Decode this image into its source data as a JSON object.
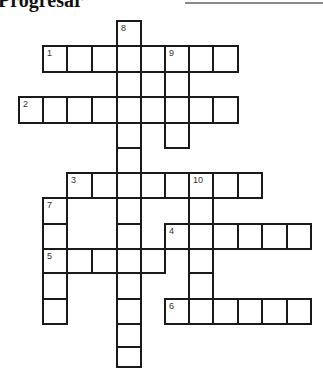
{
  "header": {
    "title": "Progresar",
    "has_name_line": true
  },
  "grid": {
    "col_x": [
      18,
      42,
      66,
      91,
      116,
      140,
      164,
      188,
      212,
      237,
      261,
      286,
      310
    ],
    "row_y": [
      20,
      45,
      71,
      96,
      122,
      147,
      172,
      197,
      223,
      248,
      272,
      298,
      323,
      346,
      366
    ],
    "cells": [
      {
        "r": 0,
        "c": 4,
        "num": "8"
      },
      {
        "r": 1,
        "c": 1,
        "num": "1"
      },
      {
        "r": 1,
        "c": 2
      },
      {
        "r": 1,
        "c": 3
      },
      {
        "r": 1,
        "c": 4
      },
      {
        "r": 1,
        "c": 5
      },
      {
        "r": 1,
        "c": 6,
        "num": "9"
      },
      {
        "r": 1,
        "c": 7
      },
      {
        "r": 1,
        "c": 8
      },
      {
        "r": 2,
        "c": 4
      },
      {
        "r": 2,
        "c": 6
      },
      {
        "r": 3,
        "c": 0,
        "num": "2"
      },
      {
        "r": 3,
        "c": 1
      },
      {
        "r": 3,
        "c": 2
      },
      {
        "r": 3,
        "c": 3
      },
      {
        "r": 3,
        "c": 4
      },
      {
        "r": 3,
        "c": 5
      },
      {
        "r": 3,
        "c": 6
      },
      {
        "r": 3,
        "c": 7
      },
      {
        "r": 3,
        "c": 8
      },
      {
        "r": 4,
        "c": 4
      },
      {
        "r": 4,
        "c": 6
      },
      {
        "r": 5,
        "c": 4
      },
      {
        "r": 6,
        "c": 2,
        "num": "3"
      },
      {
        "r": 6,
        "c": 3
      },
      {
        "r": 6,
        "c": 4
      },
      {
        "r": 6,
        "c": 5
      },
      {
        "r": 6,
        "c": 6
      },
      {
        "r": 6,
        "c": 7,
        "num": "10"
      },
      {
        "r": 6,
        "c": 8
      },
      {
        "r": 6,
        "c": 9
      },
      {
        "r": 7,
        "c": 1,
        "num": "7"
      },
      {
        "r": 7,
        "c": 4
      },
      {
        "r": 7,
        "c": 7
      },
      {
        "r": 8,
        "c": 1
      },
      {
        "r": 8,
        "c": 4
      },
      {
        "r": 8,
        "c": 6,
        "num": "4"
      },
      {
        "r": 8,
        "c": 7
      },
      {
        "r": 8,
        "c": 8
      },
      {
        "r": 8,
        "c": 9
      },
      {
        "r": 8,
        "c": 10
      },
      {
        "r": 8,
        "c": 11
      },
      {
        "r": 9,
        "c": 1,
        "num": "5"
      },
      {
        "r": 9,
        "c": 2
      },
      {
        "r": 9,
        "c": 3
      },
      {
        "r": 9,
        "c": 4
      },
      {
        "r": 9,
        "c": 5
      },
      {
        "r": 9,
        "c": 7
      },
      {
        "r": 10,
        "c": 1
      },
      {
        "r": 10,
        "c": 4
      },
      {
        "r": 10,
        "c": 7
      },
      {
        "r": 11,
        "c": 1
      },
      {
        "r": 11,
        "c": 4
      },
      {
        "r": 11,
        "c": 6,
        "num": "6"
      },
      {
        "r": 11,
        "c": 7
      },
      {
        "r": 11,
        "c": 8
      },
      {
        "r": 11,
        "c": 9
      },
      {
        "r": 11,
        "c": 10
      },
      {
        "r": 11,
        "c": 11
      },
      {
        "r": 12,
        "c": 4
      },
      {
        "r": 13,
        "c": 4
      }
    ]
  },
  "clues": {
    "across": [
      "1",
      "2",
      "3",
      "4",
      "5",
      "6"
    ],
    "down": [
      "7",
      "8",
      "9",
      "10"
    ]
  },
  "colors": {
    "border": "#1a1a1a",
    "background": "#ffffff",
    "number": "#333333"
  }
}
